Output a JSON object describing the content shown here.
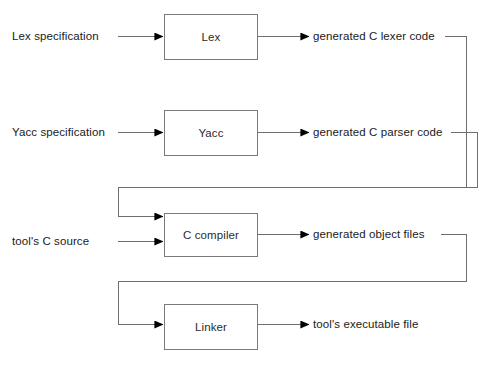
{
  "diagram": {
    "type": "flowchart",
    "colors": {
      "background": "#ffffff",
      "box_border": "#7a7a7a",
      "line": "#6e6e6e",
      "arrow_fill": "#000000",
      "text": "#1a1a1a"
    },
    "process_boxes": [
      {
        "id": "lex",
        "label": "Lex",
        "x": 164,
        "y": 14,
        "w": 94,
        "h": 46
      },
      {
        "id": "yacc",
        "label": "Yacc",
        "x": 164,
        "y": 110,
        "w": 94,
        "h": 46
      },
      {
        "id": "ccompiler",
        "label": "C compiler",
        "x": 164,
        "y": 213,
        "w": 94,
        "h": 44
      },
      {
        "id": "linker",
        "label": "Linker",
        "x": 164,
        "y": 304,
        "w": 94,
        "h": 46
      }
    ],
    "input_labels": [
      {
        "id": "lex-spec",
        "text": "Lex specification",
        "x": 12,
        "y": 36
      },
      {
        "id": "yacc-spec",
        "text": "Yacc specification",
        "x": 12,
        "y": 132
      },
      {
        "id": "tool-c-source",
        "text": "tool's C source",
        "x": 12,
        "y": 241
      }
    ],
    "output_labels": [
      {
        "id": "c-lexer-code",
        "text": "generated C lexer code",
        "x": 313,
        "y": 36
      },
      {
        "id": "c-parser-code",
        "text": "generated C parser code",
        "x": 313,
        "y": 132
      },
      {
        "id": "object-files",
        "text": "generated object files",
        "x": 313,
        "y": 234
      },
      {
        "id": "executable-file",
        "text": "tool's executable file",
        "x": 313,
        "y": 325
      }
    ],
    "edges": [
      {
        "id": "lexspec-to-lex",
        "from": "lex-spec",
        "to": "lex",
        "arrow": true
      },
      {
        "id": "lex-to-lexercode",
        "from": "lex",
        "to": "c-lexer-code",
        "arrow": true
      },
      {
        "id": "yaccspec-to-yacc",
        "from": "yacc-spec",
        "to": "yacc",
        "arrow": true
      },
      {
        "id": "yacc-to-parsercode",
        "from": "yacc",
        "to": "c-parser-code",
        "arrow": true
      },
      {
        "id": "lexercode-to-ccompiler",
        "from": "c-lexer-code",
        "to": "ccompiler",
        "arrow": true,
        "routed": true
      },
      {
        "id": "parsercode-to-ccompiler",
        "from": "c-parser-code",
        "to": "ccompiler",
        "arrow": true,
        "routed": true
      },
      {
        "id": "toolsource-to-ccompiler",
        "from": "tool-c-source",
        "to": "ccompiler",
        "arrow": true
      },
      {
        "id": "ccompiler-to-objectfiles",
        "from": "ccompiler",
        "to": "object-files",
        "arrow": true
      },
      {
        "id": "objectfiles-to-linker",
        "from": "object-files",
        "to": "linker",
        "arrow": true,
        "routed": true
      },
      {
        "id": "linker-to-executable",
        "from": "linker",
        "to": "executable-file",
        "arrow": true
      }
    ]
  }
}
